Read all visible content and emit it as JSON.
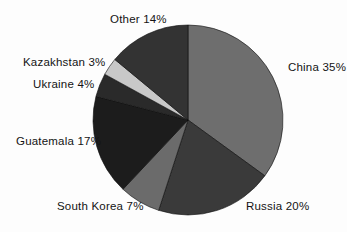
{
  "chart_data": {
    "type": "pie",
    "title": "",
    "subtitle": "",
    "xlabel": "",
    "ylabel": "",
    "grid": false,
    "legend_position": "none",
    "label_format": "{name} {value}%",
    "start_angle_deg": 0,
    "direction": "clockwise",
    "categories": [
      "China",
      "Russia",
      "South Korea",
      "Guatemala",
      "Ukraine",
      "Kazakhstan",
      "Other"
    ],
    "values": [
      35,
      20,
      7,
      17,
      4,
      3,
      14
    ],
    "colors": [
      "#6e6e6e",
      "#3a3a3a",
      "#6b6b6b",
      "#1c1c1c",
      "#2a2a2a",
      "#c8c8c8",
      "#333333"
    ],
    "slices": [
      {
        "name": "China",
        "value": 35,
        "label": "China 35%",
        "color": "#6e6e6e"
      },
      {
        "name": "Russia",
        "value": 20,
        "label": "Russia 20%",
        "color": "#3a3a3a"
      },
      {
        "name": "South Korea",
        "value": 7,
        "label": "South Korea 7%",
        "color": "#6b6b6b"
      },
      {
        "name": "Guatemala",
        "value": 17,
        "label": "Guatemala 17%",
        "color": "#1c1c1c"
      },
      {
        "name": "Ukraine",
        "value": 4,
        "label": "Ukraine 4%",
        "color": "#2a2a2a"
      },
      {
        "name": "Kazakhstan",
        "value": 3,
        "label": "Kazakhstan 3%",
        "color": "#c8c8c8"
      },
      {
        "name": "Other",
        "value": 14,
        "label": "Other 14%",
        "color": "#333333"
      }
    ],
    "geometry": {
      "cx": 188,
      "cy": 120,
      "r": 95
    }
  }
}
